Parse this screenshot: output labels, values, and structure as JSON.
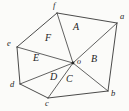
{
  "figure": {
    "width": 129,
    "height": 111,
    "background_color": "#fbfbf9",
    "stroke_color": "#2b2b2b",
    "label_color": "#1d1d1d"
  },
  "chart_data": {
    "type": "diagram",
    "shape": "hexagon",
    "vertex_labels": [
      "a",
      "b",
      "c",
      "d",
      "e",
      "f"
    ],
    "interior_point_label": "o",
    "region_labels": [
      "A",
      "B",
      "C",
      "D",
      "E",
      "F"
    ],
    "vertices": [
      {
        "id": "a",
        "label": "a",
        "x": 117,
        "y": 23
      },
      {
        "id": "b",
        "label": "b",
        "x": 108,
        "y": 91
      },
      {
        "id": "c",
        "label": "c",
        "x": 48,
        "y": 98
      },
      {
        "id": "d",
        "label": "d",
        "x": 20,
        "y": 84
      },
      {
        "id": "e",
        "label": "e",
        "x": 17,
        "y": 47
      },
      {
        "id": "f",
        "label": "f",
        "x": 57,
        "y": 13
      },
      {
        "id": "o",
        "label": "o",
        "x": 73,
        "y": 63
      }
    ],
    "vertex_label_positions": [
      {
        "label": "a",
        "x": 120,
        "y": 14
      },
      {
        "label": "b",
        "x": 111,
        "y": 92
      },
      {
        "label": "c",
        "x": 46,
        "y": 99
      },
      {
        "label": "d",
        "x": 10,
        "y": 80
      },
      {
        "label": "e",
        "x": 8,
        "y": 41
      },
      {
        "label": "f",
        "x": 53,
        "y": 2
      },
      {
        "label": "o",
        "x": 77,
        "y": 58
      }
    ],
    "boundary_edges": [
      [
        "f",
        "a"
      ],
      [
        "a",
        "b"
      ],
      [
        "b",
        "c"
      ],
      [
        "c",
        "d"
      ],
      [
        "d",
        "e"
      ],
      [
        "e",
        "f"
      ]
    ],
    "spokes": [
      [
        "o",
        "a"
      ],
      [
        "o",
        "b"
      ],
      [
        "o",
        "c"
      ],
      [
        "o",
        "d"
      ],
      [
        "o",
        "e"
      ],
      [
        "o",
        "f"
      ]
    ],
    "regions": [
      {
        "label": "A",
        "vertices": [
          "f",
          "a",
          "o"
        ],
        "x": 76,
        "y": 27
      },
      {
        "label": "B",
        "vertices": [
          "a",
          "b",
          "o"
        ],
        "x": 94,
        "y": 59
      },
      {
        "label": "C",
        "vertices": [
          "b",
          "c",
          "o"
        ],
        "x": 69,
        "y": 79
      },
      {
        "label": "D",
        "vertices": [
          "c",
          "d",
          "o"
        ],
        "x": 54,
        "y": 77
      },
      {
        "label": "E",
        "vertices": [
          "d",
          "e",
          "o"
        ],
        "x": 36,
        "y": 58
      },
      {
        "label": "F",
        "vertices": [
          "e",
          "f",
          "o"
        ],
        "x": 48,
        "y": 38
      }
    ]
  }
}
